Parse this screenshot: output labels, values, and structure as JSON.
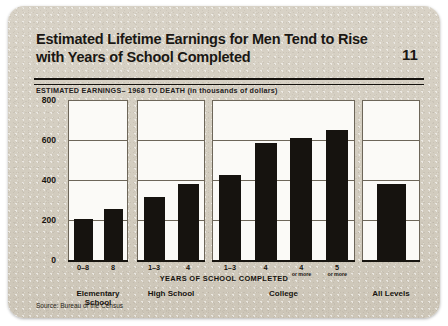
{
  "card": {
    "title": "Estimated Lifetime Earnings for Men Tend to Rise with Years of School Completed",
    "page_number": "11",
    "subtitle": "ESTIMATED EARNINGS– 1968 TO DEATH  (in thousands of dollars)",
    "source": "Source:  Bureau of the Census"
  },
  "chart_data": {
    "type": "bar",
    "title": "Estimated Lifetime Earnings for Men Tend to Rise with Years of School Completed",
    "subtitle": "ESTIMATED EARNINGS– 1968 TO DEATH  (in thousands of dollars)",
    "xlabel": "YEARS OF SCHOOL COMPLETED",
    "ylabel": "",
    "ylim": [
      0,
      800
    ],
    "yticks": [
      0,
      200,
      400,
      600,
      800
    ],
    "ytick_labels": [
      "0",
      "200",
      "400",
      "600",
      "800"
    ],
    "grid": true,
    "legend": false,
    "units": "thousands of dollars",
    "source": "Source:  Bureau of the Census",
    "groups": [
      {
        "name": "Elementary School",
        "categories": [
          "0–8",
          "8"
        ],
        "sublabels": [
          "",
          ""
        ],
        "values": [
          205,
          255
        ]
      },
      {
        "name": "High School",
        "categories": [
          "1–3",
          "4"
        ],
        "sublabels": [
          "",
          ""
        ],
        "values": [
          315,
          380
        ]
      },
      {
        "name": "College",
        "categories": [
          "1–3",
          "4",
          "4",
          "5"
        ],
        "sublabels": [
          "",
          "",
          "or more",
          "or more"
        ],
        "values": [
          425,
          585,
          610,
          650
        ]
      },
      {
        "name": "All Levels",
        "categories": [
          ""
        ],
        "sublabels": [
          ""
        ],
        "values": [
          380
        ]
      }
    ],
    "categories": [
      "0–8",
      "8",
      "1–3",
      "4",
      "1–3",
      "4",
      "4 or more",
      "5 or more",
      "All Levels"
    ],
    "values": [
      205,
      255,
      315,
      380,
      425,
      585,
      610,
      650,
      380
    ],
    "colors": {
      "bar": "#16130f",
      "panel_background": "#fbfaf7",
      "card_background": "#d4cec1",
      "axis": "#17140f",
      "grid": "#6d6659"
    }
  }
}
